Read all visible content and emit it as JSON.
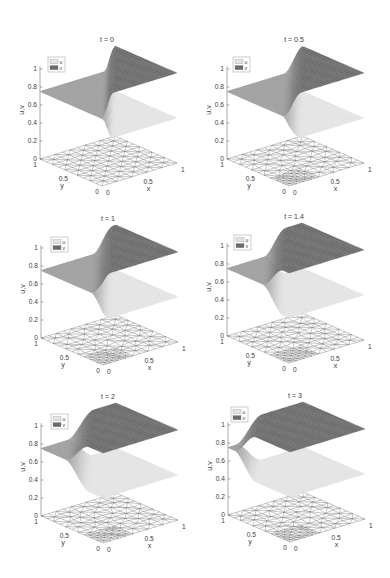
{
  "figure": {
    "colors": {
      "u": "#e3e3e3",
      "v": "#6b6b6b",
      "overlap": "#a4a4a4",
      "mesh": "#6e6e6e",
      "axis": "#555555"
    }
  },
  "chart_data": [
    {
      "type": "surface",
      "title": "t = 0",
      "xlabel": "x",
      "ylabel": "y",
      "zlabel": "u,v",
      "xticks": [
        "0",
        "0.5",
        "1"
      ],
      "yticks": [
        "0",
        "0.5",
        "1"
      ],
      "zticks": [
        "0",
        "0.2",
        "0.4",
        "0.6",
        "0.8",
        "1"
      ],
      "xlim": [
        0,
        1
      ],
      "ylim": [
        0,
        1
      ],
      "zlim": [
        0,
        1
      ],
      "grid": false,
      "legend": [
        "u",
        "v"
      ],
      "legend_position": "upper left",
      "series": [
        {
          "name": "u",
          "color": "#e3e3e3",
          "boundary_value": 0.75,
          "far_value": 0.5
        },
        {
          "name": "v",
          "color": "#6b6b6b",
          "boundary_value": 0.75,
          "far_value": 1.0
        }
      ],
      "front": {
        "k": 0.86,
        "c": 0.0,
        "w": 0.14
      },
      "profile_y1": {
        "x": [
          0,
          0.2,
          0.4,
          0.6,
          0.8,
          1
        ],
        "u": [
          0.75,
          0.75,
          0.75,
          0.75,
          0.75,
          0.5
        ],
        "v": [
          0.75,
          0.75,
          0.75,
          0.75,
          0.75,
          1.0
        ]
      },
      "mesh": {
        "plane_z": 0,
        "divisions": 10,
        "refined": false
      }
    },
    {
      "type": "surface",
      "title": "t = 0.5",
      "xlabel": "x",
      "ylabel": "y",
      "zlabel": "u,v",
      "xticks": [
        "0",
        "0.5",
        "1"
      ],
      "yticks": [
        "0",
        "0.5",
        "1"
      ],
      "zticks": [
        "0",
        "0.2",
        "0.4",
        "0.6",
        "0.8",
        "1"
      ],
      "xlim": [
        0,
        1
      ],
      "ylim": [
        0,
        1
      ],
      "zlim": [
        0,
        1
      ],
      "grid": false,
      "legend": [
        "u",
        "v"
      ],
      "legend_position": "upper left",
      "series": [
        {
          "name": "u",
          "color": "#e3e3e3",
          "boundary_value": 0.75,
          "far_value": 0.5
        },
        {
          "name": "v",
          "color": "#6b6b6b",
          "boundary_value": 0.75,
          "far_value": 1.0
        }
      ],
      "front": {
        "k": 0.86,
        "c": 0.1,
        "w": 0.26
      },
      "profile_y1": {
        "x": [
          0,
          0.2,
          0.4,
          0.6,
          0.8,
          1
        ],
        "u": [
          0.75,
          0.75,
          0.75,
          0.75,
          0.73,
          0.5
        ],
        "v": [
          0.75,
          0.75,
          0.75,
          0.75,
          0.77,
          1.0
        ]
      },
      "mesh": {
        "plane_z": 0,
        "divisions": 10,
        "refined": true
      }
    },
    {
      "type": "surface",
      "title": "t = 1",
      "xlabel": "x",
      "ylabel": "y",
      "zlabel": "u,v",
      "xticks": [
        "0",
        "0.5",
        "1"
      ],
      "yticks": [
        "0",
        "0.5",
        "1"
      ],
      "zticks": [
        "0",
        "0.2",
        "0.4",
        "0.6",
        "0.8",
        "1"
      ],
      "xlim": [
        0,
        1
      ],
      "ylim": [
        0,
        1
      ],
      "zlim": [
        0,
        1
      ],
      "grid": false,
      "legend": [
        "u",
        "v"
      ],
      "legend_position": "upper left",
      "series": [
        {
          "name": "u",
          "color": "#e3e3e3",
          "boundary_value": 0.75,
          "far_value": 0.5
        },
        {
          "name": "v",
          "color": "#6b6b6b",
          "boundary_value": 0.75,
          "far_value": 1.0
        }
      ],
      "front": {
        "k": 0.86,
        "c": 0.17,
        "w": 0.27
      },
      "profile_y1": {
        "x": [
          0,
          0.2,
          0.4,
          0.6,
          0.8,
          1
        ],
        "u": [
          0.75,
          0.75,
          0.75,
          0.75,
          0.66,
          0.5
        ],
        "v": [
          0.75,
          0.75,
          0.75,
          0.75,
          0.84,
          1.0
        ]
      },
      "mesh": {
        "plane_z": 0,
        "divisions": 10,
        "refined": true
      }
    },
    {
      "type": "surface",
      "title": "t = 1.4",
      "xlabel": "x",
      "ylabel": "y",
      "zlabel": "u,v",
      "xticks": [
        "0",
        "0.5",
        "1"
      ],
      "yticks": [
        "0",
        "0.5",
        "1"
      ],
      "zticks": [
        "0",
        "0.2",
        "0.4",
        "0.6",
        "0.8",
        "1"
      ],
      "xlim": [
        0,
        1
      ],
      "ylim": [
        0,
        1
      ],
      "zlim": [
        0,
        1
      ],
      "grid": false,
      "legend": [
        "u",
        "v"
      ],
      "legend_position": "upper left",
      "series": [
        {
          "name": "u",
          "color": "#e3e3e3",
          "boundary_value": 0.75,
          "far_value": 0.5
        },
        {
          "name": "v",
          "color": "#6b6b6b",
          "boundary_value": 0.75,
          "far_value": 1.0
        }
      ],
      "front": {
        "k": 0.86,
        "c": 0.37,
        "w": 0.29
      },
      "profile_y1": {
        "x": [
          0,
          0.2,
          0.4,
          0.6,
          0.8,
          1
        ],
        "u": [
          0.75,
          0.75,
          0.75,
          0.67,
          0.5,
          0.5
        ],
        "v": [
          0.75,
          0.75,
          0.75,
          0.83,
          1.0,
          1.0
        ]
      },
      "mesh": {
        "plane_z": 0,
        "divisions": 10,
        "refined": true
      }
    },
    {
      "type": "surface",
      "title": "t = 2",
      "xlabel": "x",
      "ylabel": "y",
      "zlabel": "u,v",
      "xticks": [
        "0",
        "0.5",
        "1"
      ],
      "yticks": [
        "0",
        "0.5",
        "1"
      ],
      "zticks": [
        "0",
        "0.2",
        "0.4",
        "0.6",
        "0.8",
        "1"
      ],
      "xlim": [
        0,
        1
      ],
      "ylim": [
        0,
        1
      ],
      "zlim": [
        0,
        1
      ],
      "grid": false,
      "legend": [
        "u",
        "v"
      ],
      "legend_position": "upper left",
      "series": [
        {
          "name": "u",
          "color": "#e3e3e3",
          "boundary_value": 0.75,
          "far_value": 0.5
        },
        {
          "name": "v",
          "color": "#6b6b6b",
          "boundary_value": 0.75,
          "far_value": 1.0
        }
      ],
      "front": {
        "k": 0.9,
        "c": 0.55,
        "w": 0.35
      },
      "profile_y1": {
        "x": [
          0,
          0.2,
          0.4,
          0.6,
          0.8,
          1
        ],
        "u": [
          0.75,
          0.75,
          0.74,
          0.55,
          0.5,
          0.5
        ],
        "v": [
          0.75,
          0.75,
          0.76,
          0.95,
          1.0,
          1.0
        ]
      },
      "mesh": {
        "plane_z": 0,
        "divisions": 10,
        "refined": true
      }
    },
    {
      "type": "surface",
      "title": "t = 3",
      "xlabel": "x",
      "ylabel": "y",
      "zlabel": "u,v",
      "xticks": [
        "0",
        "0.5",
        "1"
      ],
      "yticks": [
        "0",
        "0.5",
        "1"
      ],
      "zticks": [
        "0",
        "0.2",
        "0.4",
        "0.6",
        "0.8",
        "1"
      ],
      "xlim": [
        0,
        1
      ],
      "ylim": [
        0,
        1
      ],
      "zlim": [
        0,
        1
      ],
      "grid": false,
      "legend": [
        "u",
        "v"
      ],
      "legend_position": "upper left",
      "series": [
        {
          "name": "u",
          "color": "#e3e3e3",
          "boundary_value": 0.75,
          "far_value": 0.5
        },
        {
          "name": "v",
          "color": "#6b6b6b",
          "boundary_value": 0.75,
          "far_value": 1.0
        }
      ],
      "front": {
        "k": 1.0,
        "c": 0.9,
        "w": 0.35
      },
      "profile_y1": {
        "x": [
          0,
          0.2,
          0.4,
          0.6,
          0.8,
          1
        ],
        "u": [
          0.75,
          0.7,
          0.51,
          0.5,
          0.5,
          0.5
        ],
        "v": [
          0.75,
          0.8,
          0.99,
          1.0,
          1.0,
          1.0
        ]
      },
      "mesh": {
        "plane_z": 0,
        "divisions": 10,
        "refined": true
      }
    }
  ]
}
